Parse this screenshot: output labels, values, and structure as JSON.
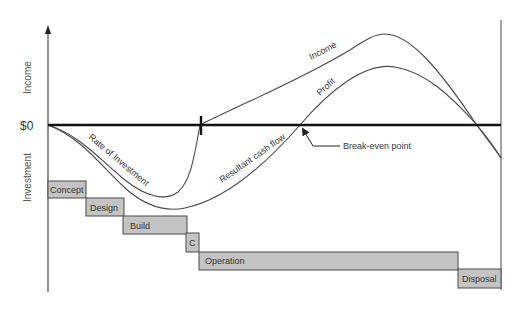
{
  "diagram": {
    "axes": {
      "y_upper_label": "Income",
      "y_lower_label": "Investment",
      "zero_label": "$0"
    },
    "curves": {
      "income_label": "Income",
      "profit_label": "Profit",
      "rate_of_investment_label": "Rate of Investment",
      "resultant_cash_flow_label": "Resultant cash flow"
    },
    "annotations": {
      "break_even_label": "Break-even point"
    },
    "phases": [
      {
        "label": "Concept"
      },
      {
        "label": "Design"
      },
      {
        "label": "Build"
      },
      {
        "label": "C"
      },
      {
        "label": "Operation"
      },
      {
        "label": "Disposal"
      }
    ],
    "colors": {
      "phase_box_fill": "#c4c4c4",
      "line": "#4a4a4a",
      "zero_line": "#111111"
    }
  }
}
